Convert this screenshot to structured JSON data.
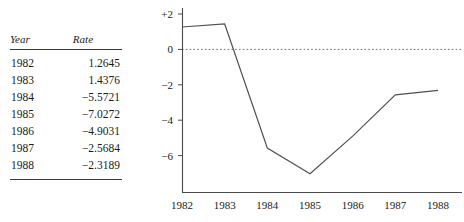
{
  "table": {
    "headers": [
      "Year",
      "Rate"
    ],
    "rows": [
      {
        "year": "1982",
        "rate": "1.2645"
      },
      {
        "year": "1983",
        "rate": "1.4376"
      },
      {
        "year": "1984",
        "rate": "−5.5721"
      },
      {
        "year": "1985",
        "rate": "−7.0272"
      },
      {
        "year": "1986",
        "rate": "−4.9031"
      },
      {
        "year": "1987",
        "rate": "−2.5684"
      },
      {
        "year": "1988",
        "rate": "−2.3189"
      }
    ]
  },
  "chart_data": {
    "type": "line",
    "title": "",
    "xlabel": "",
    "ylabel": "",
    "categories": [
      "1982",
      "1983",
      "1984",
      "1985",
      "1986",
      "1987",
      "1988"
    ],
    "x": [
      1982,
      1983,
      1984,
      1985,
      1986,
      1987,
      1988
    ],
    "values": [
      1.2645,
      1.4376,
      -5.5721,
      -7.0272,
      -4.9031,
      -2.5684,
      -2.3189
    ],
    "series": [
      {
        "name": "Rate",
        "values": [
          1.2645,
          1.4376,
          -5.5721,
          -7.0272,
          -4.9031,
          -2.5684,
          -2.3189
        ]
      }
    ],
    "ylim": [
      -7.6,
      2.4
    ],
    "xlim": [
      1982,
      1988
    ],
    "yticks": [
      2,
      0,
      -2,
      -4,
      -6
    ],
    "ytick_labels": [
      "+2",
      "0",
      "−2",
      "−4",
      "−6"
    ],
    "xticks": [
      1982,
      1983,
      1984,
      1985,
      1986,
      1987,
      1988
    ],
    "xtick_labels": [
      "1982",
      "1983",
      "1984",
      "1985",
      "1986",
      "1987",
      "1988"
    ],
    "grid": false,
    "legend": "none",
    "reference_lines": [
      {
        "axis": "y",
        "value": 0,
        "style": "dotted"
      }
    ],
    "line_color": "#4f4f4f",
    "axis_color": "#4a4a4a"
  }
}
